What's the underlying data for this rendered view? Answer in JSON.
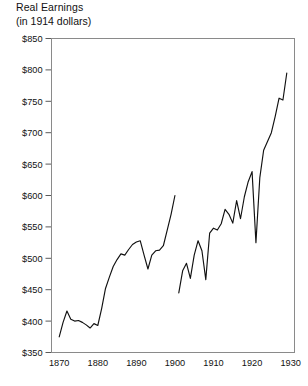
{
  "chart_data": {
    "type": "line",
    "title": "Real Earnings",
    "subtitle": "(in 1914 dollars)",
    "xlabel": "",
    "ylabel": "",
    "xlim": [
      1868,
      1931
    ],
    "ylim": [
      350,
      850
    ],
    "grid": false,
    "legend": "none",
    "y_ticks": [
      350,
      400,
      450,
      500,
      550,
      600,
      650,
      700,
      750,
      800,
      850
    ],
    "y_tick_labels": [
      "$350",
      "$400",
      "$450",
      "$500",
      "$550",
      "$600",
      "$650",
      "$700",
      "$750",
      "$800",
      "$850"
    ],
    "x_ticks": [
      1870,
      1880,
      1890,
      1900,
      1910,
      1920,
      1930
    ],
    "x_tick_labels": [
      "1870",
      "1880",
      "1890",
      "1900",
      "1910",
      "1920",
      "1930"
    ],
    "line_color": "#111111",
    "frame_color": "#8a8a8a",
    "series": [
      {
        "name": "Real earnings 1870-1900",
        "x": [
          1870,
          1871,
          1872,
          1873,
          1874,
          1875,
          1876,
          1877,
          1878,
          1879,
          1880,
          1881,
          1882,
          1883,
          1884,
          1885,
          1886,
          1887,
          1888,
          1889,
          1890,
          1891,
          1892,
          1893,
          1894,
          1895,
          1896,
          1897,
          1898,
          1899,
          1900
        ],
        "values": [
          375,
          398,
          416,
          403,
          400,
          401,
          398,
          394,
          389,
          396,
          393,
          420,
          452,
          470,
          487,
          498,
          507,
          505,
          514,
          522,
          526,
          528,
          505,
          483,
          505,
          512,
          513,
          520,
          545,
          570,
          600
        ]
      },
      {
        "name": "Real earnings 1901-1929",
        "x": [
          1901,
          1902,
          1903,
          1904,
          1905,
          1906,
          1907,
          1908,
          1909,
          1910,
          1911,
          1912,
          1913,
          1914,
          1915,
          1916,
          1917,
          1918,
          1919,
          1920,
          1921,
          1922,
          1923,
          1924,
          1925,
          1926,
          1927,
          1928,
          1929
        ],
        "values": [
          445,
          480,
          492,
          468,
          505,
          528,
          512,
          466,
          540,
          548,
          545,
          555,
          578,
          570,
          556,
          592,
          563,
          598,
          622,
          638,
          525,
          628,
          672,
          686,
          700,
          726,
          755,
          752,
          795
        ]
      }
    ]
  }
}
